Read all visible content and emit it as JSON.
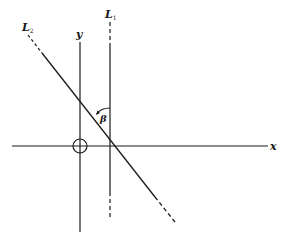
{
  "diagram": {
    "type": "coordinate-geometry",
    "colors": {
      "line": "#1a1a1a",
      "background": "#ffffff"
    },
    "axes": {
      "x": {
        "label": "x"
      },
      "y": {
        "label": "y"
      }
    },
    "origin_marker": "circle",
    "lines": [
      {
        "id": "L1",
        "label_main": "L",
        "label_sub": "1",
        "orientation": "vertical",
        "style": "solid with dashed ends"
      },
      {
        "id": "L2",
        "label_main": "L",
        "label_sub": "2",
        "orientation": "descending diagonal",
        "style": "solid with dashed ends"
      }
    ],
    "angle": {
      "label": "β",
      "between": [
        "L1",
        "L2"
      ]
    }
  }
}
